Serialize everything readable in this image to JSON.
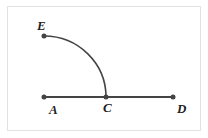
{
  "diagram": {
    "points": [
      {
        "id": "E",
        "label": "E",
        "x": 44,
        "y": 36
      },
      {
        "id": "A",
        "label": "A",
        "x": 44,
        "y": 97
      },
      {
        "id": "C",
        "label": "C",
        "x": 106,
        "y": 97
      },
      {
        "id": "D",
        "label": "D",
        "x": 173,
        "y": 97
      }
    ],
    "segments": [
      {
        "from": "A",
        "to": "D"
      }
    ],
    "arcs": [
      {
        "from": "E",
        "to": "C",
        "center": "A"
      }
    ],
    "colors": {
      "line": "#444444",
      "point": "#444444"
    }
  }
}
